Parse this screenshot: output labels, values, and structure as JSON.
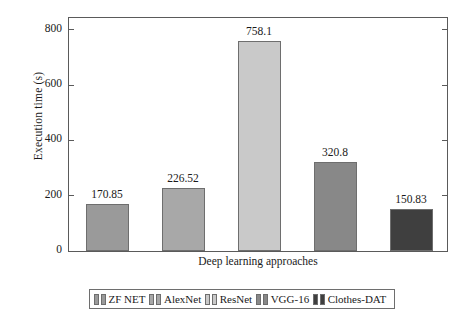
{
  "chart_data": {
    "type": "bar",
    "title": "",
    "xlabel": "Deep learning approaches",
    "ylabel": "Execution time (s)",
    "categories": [
      "ZF NET",
      "AlexNet",
      "ResNet",
      "VGG-16",
      "Clothes-DAT"
    ],
    "values": [
      170.85,
      226.52,
      758.1,
      320.8,
      150.83
    ],
    "value_labels": [
      "170.85",
      "226.52",
      "758.1",
      "320.8",
      "150.83"
    ],
    "ylim": [
      0,
      850
    ],
    "yticks": [
      0,
      200,
      400,
      600,
      800
    ],
    "ytick_labels": [
      "0",
      "200",
      "400",
      "600",
      "800"
    ],
    "grid": false,
    "legend_position": "bottom",
    "series": [
      {
        "name": "Execution time",
        "values": [
          170.85,
          226.52,
          758.1,
          320.8,
          150.83
        ]
      }
    ],
    "bar_colors": [
      "#9a9a9a",
      "#a8a8a8",
      "#c9c9c9",
      "#888888",
      "#3f3f3f"
    ]
  },
  "legend": {
    "items": [
      {
        "label": "ZF NET",
        "color": "#9a9a9a"
      },
      {
        "label": "AlexNet",
        "color": "#a8a8a8"
      },
      {
        "label": "ResNet",
        "color": "#c9c9c9"
      },
      {
        "label": "VGG-16",
        "color": "#888888"
      },
      {
        "label": "Clothes-DAT",
        "color": "#3f3f3f"
      }
    ]
  },
  "axes": {
    "y_title": "Execution time (s)",
    "x_title": "Deep learning approaches"
  }
}
